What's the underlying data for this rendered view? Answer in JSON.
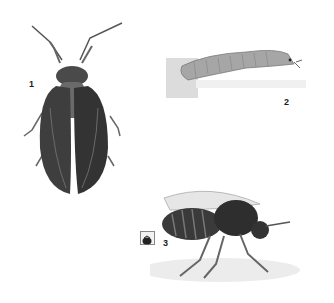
{
  "figure": {
    "panels": [
      {
        "id": "1",
        "label": "1",
        "subject": "adult caddisfly (top view, wings folded)"
      },
      {
        "id": "2",
        "label": "2",
        "subject": "larva (side view)"
      },
      {
        "id": "3",
        "label": "3",
        "subject": "adult fly (side view)",
        "icon": "insect-badge-icon"
      }
    ],
    "colors": {
      "background": "#ffffff",
      "ink": "#2a2a2a",
      "wing": "#3a3a3a",
      "larva": "#9a9a9a",
      "shadow": "#e4e4e4"
    }
  }
}
